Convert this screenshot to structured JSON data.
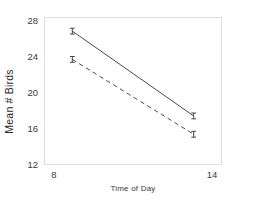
{
  "chart_data": {
    "type": "line",
    "title": "",
    "xlabel": "Time of Day",
    "ylabel": "Mean # Birds",
    "x": [
      8,
      14
    ],
    "xticks": [
      8,
      14
    ],
    "yticks": [
      12,
      16,
      20,
      24,
      28
    ],
    "xlim": [
      6.6,
      15.4
    ],
    "ylim": [
      11.1,
      28.9
    ],
    "grid": false,
    "legend": "none",
    "series": [
      {
        "name": "solid-line",
        "style": "solid",
        "color": "#333333",
        "values": [
          27.2,
          17.0
        ],
        "errorbars": [
          0.35,
          0.35
        ]
      },
      {
        "name": "dashed-line",
        "style": "dashed",
        "color": "#333333",
        "values": [
          23.8,
          14.8
        ],
        "errorbars": [
          0.35,
          0.35
        ]
      }
    ]
  },
  "axes": {
    "y_tick_labels": [
      "12",
      "16",
      "20",
      "24",
      "28"
    ],
    "x_tick_labels": [
      "8",
      "14"
    ],
    "y_axis_title": "Mean # Birds",
    "x_axis_title": "Time of Day"
  },
  "figure": {
    "title": "",
    "background": "#ffffff",
    "frame_color": "#dedede",
    "text_color": "#3a3a3a"
  }
}
